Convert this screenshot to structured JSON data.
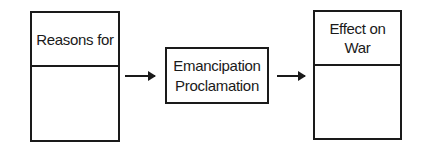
{
  "diagram": {
    "left_box": {
      "header": "Reasons for",
      "body": ""
    },
    "center_box": {
      "line1": "Emancipation",
      "line2": "Proclamation"
    },
    "right_box": {
      "header_line1": "Effect on",
      "header_line2": "War",
      "body": ""
    },
    "arrows": [
      "left-to-center",
      "center-to-right"
    ],
    "colors": {
      "stroke": "#1a1a1a",
      "background": "#ffffff"
    }
  }
}
